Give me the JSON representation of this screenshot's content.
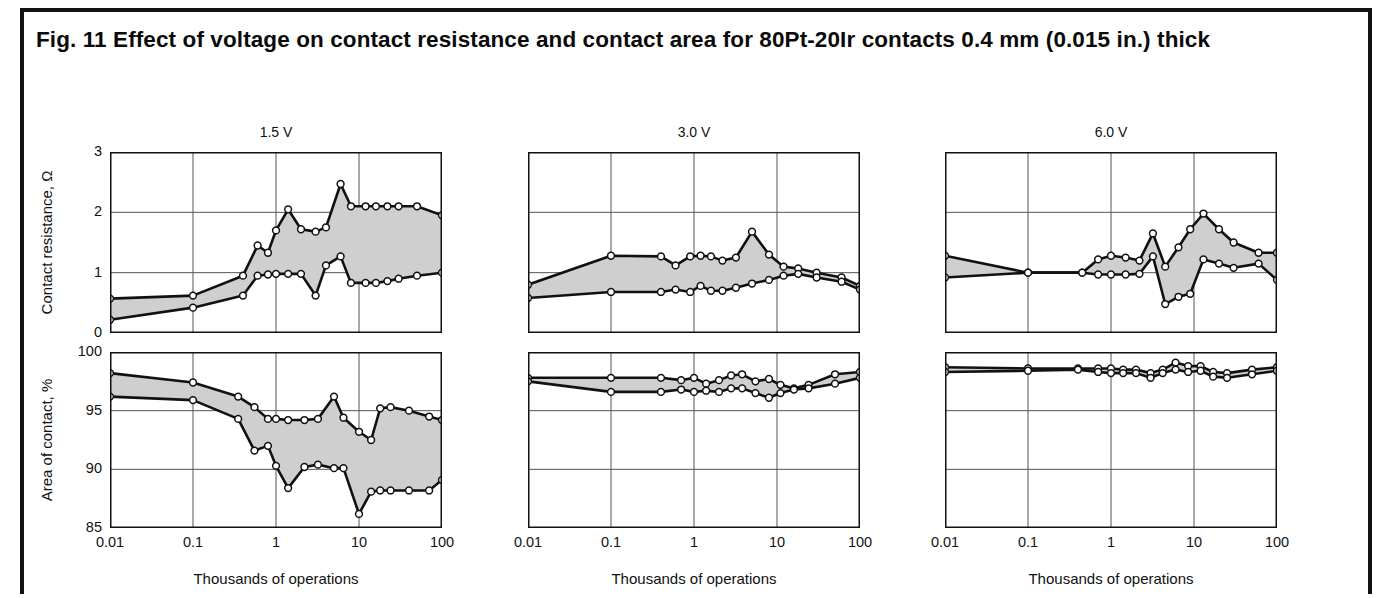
{
  "caption": "Fig. 11 Effect of voltage on contact resistance and contact area for 80Pt-20Ir contacts 0.4 mm (0.015 in.) thick",
  "axis": {
    "xlabel": "Thousands of operations",
    "ylabel_resistance": "Contact resistance, Ω",
    "ylabel_area": "Area of contact, %",
    "xticks": [
      "0.01",
      "0.1",
      "1",
      "10",
      "100"
    ],
    "yticks_resistance": [
      "0",
      "1",
      "2",
      "3"
    ],
    "yticks_area": [
      "85",
      "90",
      "95",
      "100"
    ]
  },
  "panel_titles": [
    "1.5 V",
    "3.0 V",
    "6.0 V"
  ],
  "colors": {
    "band_fill": "#cfcfcf",
    "line": "#111111",
    "marker_fill": "#ffffff",
    "grid": "#555555",
    "frame": "#111111"
  },
  "chart_data": [
    {
      "type": "area",
      "title": "1.5 V",
      "panel": "contact-resistance-1.5v",
      "xlabel": "Thousands of operations",
      "ylabel": "Contact resistance, Ω",
      "xscale": "log",
      "xlim": [
        0.01,
        100
      ],
      "ylim": [
        0,
        3
      ],
      "xticks": [
        0.01,
        0.1,
        1,
        10,
        100
      ],
      "yticks": [
        0,
        1,
        2,
        3
      ],
      "grid": true,
      "legend": "none",
      "x": [
        0.01,
        0.1,
        0.4,
        0.6,
        0.8,
        1.0,
        1.4,
        2.0,
        3.0,
        4.0,
        6.0,
        8.0,
        12,
        16,
        22,
        30,
        50,
        100
      ],
      "series": [
        {
          "name": "maximum",
          "values": [
            0.57,
            0.62,
            0.95,
            1.45,
            1.33,
            1.7,
            2.05,
            1.72,
            1.68,
            1.75,
            2.47,
            2.1,
            2.1,
            2.1,
            2.1,
            2.1,
            2.1,
            1.95
          ]
        },
        {
          "name": "minimum",
          "values": [
            0.22,
            0.42,
            0.62,
            0.95,
            0.97,
            0.98,
            0.98,
            0.98,
            0.62,
            1.12,
            1.27,
            0.83,
            0.83,
            0.83,
            0.86,
            0.9,
            0.95,
            1.0
          ]
        }
      ]
    },
    {
      "type": "area",
      "title": "3.0 V",
      "panel": "contact-resistance-3.0v",
      "xlabel": "Thousands of operations",
      "ylabel": "Contact resistance, Ω",
      "xscale": "log",
      "xlim": [
        0.01,
        100
      ],
      "ylim": [
        0,
        3
      ],
      "xticks": [
        0.01,
        0.1,
        1,
        10,
        100
      ],
      "yticks": [
        0,
        1,
        2,
        3
      ],
      "grid": true,
      "legend": "none",
      "x": [
        0.01,
        0.1,
        0.4,
        0.6,
        0.9,
        1.2,
        1.6,
        2.2,
        3.2,
        5.0,
        8.0,
        12,
        18,
        30,
        60,
        100
      ],
      "series": [
        {
          "name": "maximum",
          "values": [
            0.8,
            1.28,
            1.27,
            1.12,
            1.27,
            1.28,
            1.27,
            1.2,
            1.25,
            1.68,
            1.3,
            1.1,
            1.07,
            1.0,
            0.92,
            0.78
          ]
        },
        {
          "name": "minimum",
          "values": [
            0.58,
            0.68,
            0.68,
            0.72,
            0.68,
            0.78,
            0.7,
            0.7,
            0.75,
            0.82,
            0.88,
            0.95,
            0.98,
            0.92,
            0.85,
            0.72
          ]
        }
      ]
    },
    {
      "type": "area",
      "title": "6.0 V",
      "panel": "contact-resistance-6.0v",
      "xlabel": "Thousands of operations",
      "ylabel": "Contact resistance, Ω",
      "xscale": "log",
      "xlim": [
        0.01,
        100
      ],
      "ylim": [
        0,
        3
      ],
      "xticks": [
        0.01,
        0.1,
        1,
        10,
        100
      ],
      "yticks": [
        0,
        1,
        2,
        3
      ],
      "grid": true,
      "legend": "none",
      "x": [
        0.01,
        0.1,
        0.45,
        0.7,
        1.0,
        1.5,
        2.2,
        3.2,
        4.5,
        6.5,
        9.0,
        13,
        20,
        30,
        60,
        100
      ],
      "series": [
        {
          "name": "maximum",
          "values": [
            1.28,
            1.0,
            1.0,
            1.22,
            1.28,
            1.25,
            1.2,
            1.65,
            1.1,
            1.42,
            1.72,
            1.98,
            1.72,
            1.5,
            1.33,
            1.33
          ]
        },
        {
          "name": "minimum",
          "values": [
            0.92,
            1.0,
            1.0,
            0.97,
            0.97,
            0.97,
            0.98,
            1.27,
            0.48,
            0.6,
            0.65,
            1.22,
            1.15,
            1.08,
            1.15,
            0.88
          ]
        }
      ]
    },
    {
      "type": "area",
      "title": "1.5 V",
      "panel": "area-of-contact-1.5v",
      "xlabel": "Thousands of operations",
      "ylabel": "Area of contact, %",
      "xscale": "log",
      "xlim": [
        0.01,
        100
      ],
      "ylim": [
        85,
        100
      ],
      "xticks": [
        0.01,
        0.1,
        1,
        10,
        100
      ],
      "yticks": [
        85,
        90,
        95,
        100
      ],
      "grid": true,
      "legend": "none",
      "x": [
        0.01,
        0.1,
        0.35,
        0.55,
        0.8,
        1.0,
        1.4,
        2.2,
        3.2,
        5.0,
        6.5,
        10,
        14,
        18,
        24,
        40,
        70,
        100
      ],
      "series": [
        {
          "name": "maximum",
          "values": [
            98.2,
            97.4,
            96.2,
            95.3,
            94.3,
            94.3,
            94.2,
            94.2,
            94.3,
            96.2,
            94.4,
            93.2,
            92.5,
            95.2,
            95.3,
            95.0,
            94.5,
            94.2
          ]
        },
        {
          "name": "minimum",
          "values": [
            96.2,
            95.9,
            94.3,
            91.6,
            92.0,
            90.3,
            88.4,
            90.2,
            90.4,
            90.1,
            90.1,
            86.2,
            88.1,
            88.2,
            88.2,
            88.2,
            88.2,
            89.1
          ]
        }
      ]
    },
    {
      "type": "area",
      "title": "3.0 V",
      "panel": "area-of-contact-3.0v",
      "xlabel": "Thousands of operations",
      "ylabel": "Area of contact, %",
      "xscale": "log",
      "xlim": [
        0.01,
        100
      ],
      "ylim": [
        85,
        100
      ],
      "xticks": [
        0.01,
        0.1,
        1,
        10,
        100
      ],
      "yticks": [
        85,
        90,
        95,
        100
      ],
      "grid": true,
      "legend": "none",
      "x": [
        0.01,
        0.1,
        0.4,
        0.7,
        1.0,
        1.4,
        2.0,
        2.8,
        3.8,
        5.5,
        8.0,
        11,
        16,
        24,
        50,
        100
      ],
      "series": [
        {
          "name": "maximum",
          "values": [
            97.8,
            97.8,
            97.8,
            97.6,
            97.8,
            97.3,
            97.6,
            98.0,
            98.1,
            97.5,
            97.7,
            97.2,
            96.9,
            97.2,
            98.1,
            98.3
          ]
        },
        {
          "name": "minimum",
          "values": [
            97.5,
            96.6,
            96.6,
            96.8,
            96.6,
            96.7,
            96.6,
            96.9,
            96.9,
            96.5,
            96.1,
            96.5,
            96.8,
            96.9,
            97.3,
            97.8
          ]
        }
      ]
    },
    {
      "type": "area",
      "title": "6.0 V",
      "panel": "area-of-contact-6.0v",
      "xlabel": "Thousands of operations",
      "ylabel": "Area of contact, %",
      "xscale": "log",
      "xlim": [
        85,
        100
      ],
      "ylim": [
        85,
        100
      ],
      "xticks": [
        0.01,
        0.1,
        1,
        10,
        100
      ],
      "yticks": [
        85,
        90,
        95,
        100
      ],
      "grid": true,
      "legend": "none",
      "x": [
        0.01,
        0.1,
        0.4,
        0.7,
        1.0,
        1.4,
        2.0,
        3.0,
        4.2,
        6.0,
        8.5,
        12,
        17,
        25,
        50,
        100
      ],
      "series": [
        {
          "name": "maximum",
          "values": [
            98.7,
            98.6,
            98.6,
            98.6,
            98.6,
            98.5,
            98.5,
            98.2,
            98.5,
            99.1,
            98.8,
            98.8,
            98.3,
            98.2,
            98.5,
            98.7
          ]
        },
        {
          "name": "minimum",
          "values": [
            98.3,
            98.4,
            98.5,
            98.3,
            98.2,
            98.2,
            98.2,
            97.8,
            98.2,
            98.5,
            98.3,
            98.4,
            97.9,
            97.8,
            98.1,
            98.4
          ]
        }
      ]
    }
  ]
}
